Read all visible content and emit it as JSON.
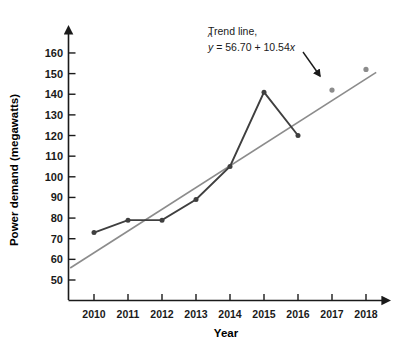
{
  "chart_data": {
    "type": "line",
    "title": "",
    "xlabel": "Year",
    "ylabel": "Power demand (megawatts)",
    "x": [
      2010,
      2011,
      2012,
      2013,
      2014,
      2015,
      2016,
      2017,
      2018
    ],
    "xtick_labels": [
      "2010",
      "2011",
      "2012",
      "2013",
      "2014",
      "2015",
      "2016",
      "2017",
      "2018"
    ],
    "ytick_labels": [
      "50",
      "60",
      "70",
      "80",
      "90",
      "100",
      "110",
      "120",
      "130",
      "140",
      "150",
      "160"
    ],
    "ytick_values": [
      50,
      60,
      70,
      80,
      90,
      100,
      110,
      120,
      130,
      140,
      150,
      160
    ],
    "ylim": [
      45,
      165
    ],
    "xlim": [
      2009.3,
      2018.6
    ],
    "grid": false,
    "legend": "none",
    "series": [
      {
        "name": "Power demand",
        "type": "line",
        "color": "#3f3f3f",
        "marker": "circle",
        "x": [
          2010,
          2011,
          2012,
          2013,
          2014,
          2015,
          2016
        ],
        "values": [
          73,
          79,
          79,
          89,
          105,
          141,
          120
        ]
      },
      {
        "name": "Trend line",
        "type": "line",
        "color": "#8c8c8c",
        "marker": "circle",
        "marker_x": [
          2017,
          2018
        ],
        "marker_values": [
          142,
          152
        ],
        "equation_x": [
          2009.3,
          2018.3
        ],
        "equation_values": [
          55.8,
          150.6
        ]
      }
    ],
    "annotations": [
      {
        "name": "trend-line-annotation",
        "line1": "Trend line,",
        "line2_prefix": "y",
        "line2_rest": " = 56.70 + 10.54",
        "line2_var": "x",
        "has_hat": true,
        "arrow": true
      }
    ]
  },
  "axes": {
    "x_axis_name": "x-axis",
    "y_axis_name": "y-axis"
  }
}
